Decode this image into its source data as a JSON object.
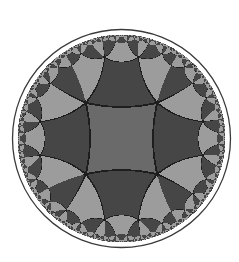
{
  "figure": {
    "title": "Hyperbolic tiling of the Poincaré disk",
    "type": "hyperbolic-tiling",
    "schlafli": "{4,5}",
    "disk": {
      "cx": 121.5,
      "cy": 138.5,
      "r": 104,
      "outer_ring_r": 109
    },
    "colors": {
      "background": "#ffffff",
      "center_tile": "#6a6a6a",
      "dark_tile": "#464646",
      "light_tile": "#9c9c9c",
      "edge": "#1e1e1e",
      "ring": "#3a3a3a"
    }
  }
}
